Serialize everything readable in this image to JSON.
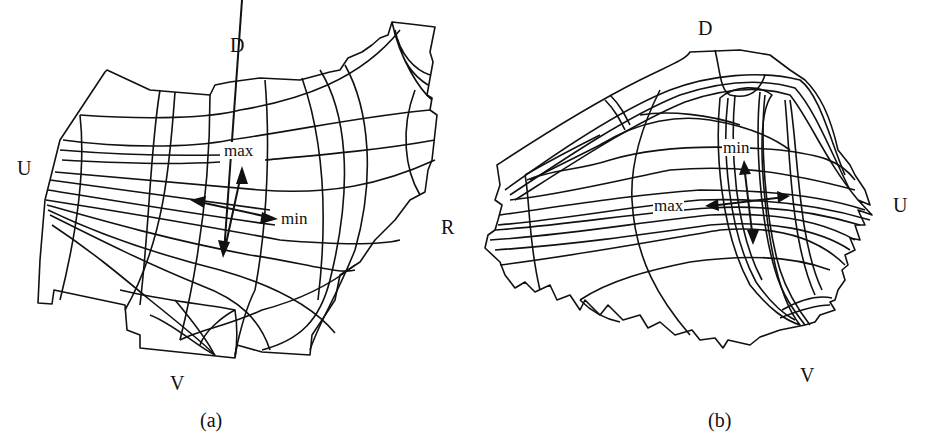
{
  "figure": {
    "panels": [
      {
        "id": "a",
        "caption": "(a)",
        "orientation_labels": {
          "top": "D",
          "left": "U",
          "right": "R",
          "bottom": "V"
        },
        "annotations": {
          "max": "max",
          "min": "min"
        }
      },
      {
        "id": "b",
        "caption": "(b)",
        "orientation_labels": {
          "top": "D",
          "right": "U",
          "bottom": "V"
        },
        "annotations": {
          "max": "max",
          "min": "min"
        }
      }
    ],
    "colors": {
      "line": "#111111",
      "background": "#ffffff"
    }
  }
}
